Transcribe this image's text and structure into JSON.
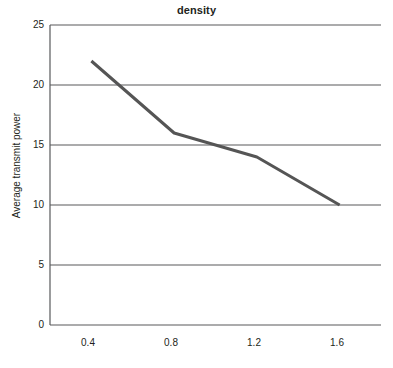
{
  "chart_data": {
    "type": "line",
    "title": "density",
    "xlabel": "",
    "ylabel": "Average transmit power",
    "x": [
      0.4,
      0.8,
      1.2,
      1.6
    ],
    "values": [
      22,
      16,
      14,
      10
    ],
    "series": [
      {
        "name": "density",
        "values": [
          22,
          16,
          14,
          10
        ],
        "color": "#555555"
      }
    ],
    "xlim": [
      0.2,
      1.8
    ],
    "ylim": [
      0,
      25
    ],
    "xticks": [
      0.4,
      0.8,
      1.2,
      1.6
    ],
    "xtick_labels": [
      "0.4",
      "0.8",
      "1.2",
      "1.6"
    ],
    "yticks": [
      0,
      5,
      10,
      15,
      20,
      25
    ],
    "ytick_labels": [
      "0",
      "5",
      "10",
      "15",
      "20",
      "25"
    ],
    "grid": "horizontal",
    "legend": "none",
    "annotations": []
  },
  "style": {
    "line_color": "#555555",
    "grid_color": "#58595b",
    "axis_color": "#58595b",
    "text_color": "#231f20",
    "background": "#ffffff"
  }
}
